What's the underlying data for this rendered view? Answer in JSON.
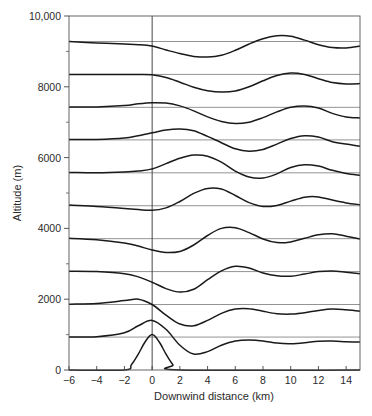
{
  "chart_data": {
    "type": "line",
    "title": "",
    "xlabel": "Downwind distance (km)",
    "ylabel": "Altitude (m)",
    "xlim": [
      -6,
      15
    ],
    "ylim": [
      0,
      10000
    ],
    "x_ticks": [
      -6,
      -4,
      -2,
      0,
      2,
      4,
      6,
      8,
      10,
      12,
      14
    ],
    "x_tick_labels": [
      "−6",
      "−4",
      "−2",
      "0",
      "2",
      "4",
      "6",
      "8",
      "10",
      "12",
      "14"
    ],
    "y_ticks": [
      0,
      2000,
      4000,
      6000,
      8000,
      10000
    ],
    "y_tick_labels": [
      "0",
      "2000",
      "4000",
      "6000",
      "8000",
      "10,000"
    ],
    "y_minor_ticks": [
      1000,
      3000,
      5000,
      7000,
      9000
    ],
    "grid": false,
    "legend": null,
    "vertical_reference_x": 0,
    "reference_levels_m": [
      0,
      930,
      1850,
      2780,
      3710,
      4640,
      5570,
      6500,
      7420,
      8350,
      9280
    ],
    "series": [
      {
        "name": "streamline-0",
        "level": 0,
        "points": [
          [
            -6,
            0
          ],
          [
            -2,
            0
          ],
          [
            -1.5,
            150
          ],
          [
            -1,
            450
          ],
          [
            -0.5,
            800
          ],
          [
            0,
            1000
          ],
          [
            0.5,
            800
          ],
          [
            1,
            450
          ],
          [
            1.5,
            150
          ],
          [
            2,
            0
          ],
          [
            15,
            0
          ]
        ]
      },
      {
        "name": "streamline-1",
        "level": 930,
        "points": [
          [
            -6,
            930
          ],
          [
            -4,
            940
          ],
          [
            -2,
            1050
          ],
          [
            -1,
            1250
          ],
          [
            0,
            1400
          ],
          [
            1,
            1150
          ],
          [
            2,
            700
          ],
          [
            3,
            450
          ],
          [
            4,
            520
          ],
          [
            5,
            700
          ],
          [
            6,
            820
          ],
          [
            7,
            850
          ],
          [
            8,
            820
          ],
          [
            9,
            760
          ],
          [
            10,
            740
          ],
          [
            11,
            770
          ],
          [
            12,
            810
          ],
          [
            13,
            820
          ],
          [
            14,
            800
          ],
          [
            15,
            790
          ]
        ]
      },
      {
        "name": "streamline-2",
        "level": 1850,
        "points": [
          [
            -6,
            1860
          ],
          [
            -4,
            1880
          ],
          [
            -2,
            1960
          ],
          [
            -1,
            2000
          ],
          [
            0,
            1850
          ],
          [
            1,
            1550
          ],
          [
            2,
            1300
          ],
          [
            3,
            1250
          ],
          [
            4,
            1400
          ],
          [
            5,
            1600
          ],
          [
            6,
            1720
          ],
          [
            7,
            1730
          ],
          [
            8,
            1660
          ],
          [
            9,
            1590
          ],
          [
            10,
            1580
          ],
          [
            11,
            1620
          ],
          [
            12,
            1680
          ],
          [
            13,
            1720
          ],
          [
            14,
            1700
          ],
          [
            15,
            1660
          ]
        ]
      },
      {
        "name": "streamline-3",
        "level": 2780,
        "points": [
          [
            -6,
            2790
          ],
          [
            -4,
            2780
          ],
          [
            -2,
            2720
          ],
          [
            -1,
            2630
          ],
          [
            0,
            2480
          ],
          [
            1,
            2300
          ],
          [
            2,
            2200
          ],
          [
            3,
            2280
          ],
          [
            4,
            2550
          ],
          [
            5,
            2800
          ],
          [
            6,
            2930
          ],
          [
            7,
            2880
          ],
          [
            8,
            2740
          ],
          [
            9,
            2660
          ],
          [
            10,
            2650
          ],
          [
            11,
            2710
          ],
          [
            12,
            2780
          ],
          [
            13,
            2800
          ],
          [
            14,
            2760
          ],
          [
            15,
            2720
          ]
        ]
      },
      {
        "name": "streamline-4",
        "level": 3710,
        "points": [
          [
            -6,
            3720
          ],
          [
            -4,
            3680
          ],
          [
            -2,
            3590
          ],
          [
            -1,
            3500
          ],
          [
            0,
            3390
          ],
          [
            1,
            3320
          ],
          [
            2,
            3350
          ],
          [
            3,
            3530
          ],
          [
            4,
            3800
          ],
          [
            5,
            4000
          ],
          [
            6,
            4020
          ],
          [
            7,
            3880
          ],
          [
            8,
            3700
          ],
          [
            9,
            3600
          ],
          [
            10,
            3620
          ],
          [
            11,
            3720
          ],
          [
            12,
            3820
          ],
          [
            13,
            3850
          ],
          [
            14,
            3780
          ],
          [
            15,
            3700
          ]
        ]
      },
      {
        "name": "streamline-5",
        "level": 4640,
        "points": [
          [
            -6,
            4660
          ],
          [
            -4,
            4620
          ],
          [
            -2,
            4560
          ],
          [
            -1,
            4530
          ],
          [
            0,
            4510
          ],
          [
            1,
            4580
          ],
          [
            2,
            4760
          ],
          [
            3,
            4990
          ],
          [
            4,
            5130
          ],
          [
            5,
            5110
          ],
          [
            6,
            4930
          ],
          [
            7,
            4730
          ],
          [
            8,
            4620
          ],
          [
            9,
            4650
          ],
          [
            10,
            4770
          ],
          [
            11,
            4880
          ],
          [
            12,
            4890
          ],
          [
            13,
            4800
          ],
          [
            14,
            4720
          ],
          [
            15,
            4670
          ]
        ]
      },
      {
        "name": "streamline-6",
        "level": 5570,
        "points": [
          [
            -6,
            5580
          ],
          [
            -4,
            5570
          ],
          [
            -2,
            5590
          ],
          [
            -1,
            5620
          ],
          [
            0,
            5680
          ],
          [
            1,
            5830
          ],
          [
            2,
            5980
          ],
          [
            3,
            6070
          ],
          [
            4,
            6040
          ],
          [
            5,
            5870
          ],
          [
            6,
            5620
          ],
          [
            7,
            5450
          ],
          [
            8,
            5420
          ],
          [
            9,
            5540
          ],
          [
            10,
            5720
          ],
          [
            11,
            5800
          ],
          [
            12,
            5760
          ],
          [
            13,
            5640
          ],
          [
            14,
            5550
          ],
          [
            15,
            5500
          ]
        ]
      },
      {
        "name": "streamline-7",
        "level": 6500,
        "points": [
          [
            -6,
            6510
          ],
          [
            -4,
            6510
          ],
          [
            -2,
            6550
          ],
          [
            -1,
            6620
          ],
          [
            0,
            6700
          ],
          [
            1,
            6780
          ],
          [
            2,
            6810
          ],
          [
            3,
            6760
          ],
          [
            4,
            6600
          ],
          [
            5,
            6420
          ],
          [
            6,
            6250
          ],
          [
            7,
            6180
          ],
          [
            8,
            6230
          ],
          [
            9,
            6380
          ],
          [
            10,
            6540
          ],
          [
            11,
            6620
          ],
          [
            12,
            6580
          ],
          [
            13,
            6450
          ],
          [
            14,
            6380
          ],
          [
            15,
            6320
          ]
        ]
      },
      {
        "name": "streamline-8",
        "level": 7420,
        "points": [
          [
            -6,
            7430
          ],
          [
            -4,
            7430
          ],
          [
            -2,
            7470
          ],
          [
            -1,
            7520
          ],
          [
            0,
            7550
          ],
          [
            1,
            7540
          ],
          [
            2,
            7460
          ],
          [
            3,
            7320
          ],
          [
            4,
            7150
          ],
          [
            5,
            7020
          ],
          [
            6,
            6960
          ],
          [
            7,
            7000
          ],
          [
            8,
            7130
          ],
          [
            9,
            7290
          ],
          [
            10,
            7420
          ],
          [
            11,
            7460
          ],
          [
            12,
            7400
          ],
          [
            13,
            7250
          ],
          [
            14,
            7150
          ],
          [
            15,
            7120
          ]
        ]
      },
      {
        "name": "streamline-9",
        "level": 8350,
        "points": [
          [
            -6,
            8350
          ],
          [
            -4,
            8350
          ],
          [
            -2,
            8350
          ],
          [
            -1,
            8350
          ],
          [
            0,
            8340
          ],
          [
            1,
            8260
          ],
          [
            2,
            8130
          ],
          [
            3,
            7990
          ],
          [
            4,
            7890
          ],
          [
            5,
            7850
          ],
          [
            6,
            7880
          ],
          [
            7,
            8000
          ],
          [
            8,
            8170
          ],
          [
            9,
            8320
          ],
          [
            10,
            8390
          ],
          [
            11,
            8350
          ],
          [
            12,
            8230
          ],
          [
            13,
            8120
          ],
          [
            14,
            8080
          ],
          [
            15,
            8090
          ]
        ]
      },
      {
        "name": "streamline-10",
        "level": 9280,
        "points": [
          [
            -6,
            9280
          ],
          [
            -4,
            9240
          ],
          [
            -2,
            9210
          ],
          [
            -1,
            9190
          ],
          [
            0,
            9150
          ],
          [
            1,
            9040
          ],
          [
            2,
            8940
          ],
          [
            3,
            8860
          ],
          [
            4,
            8840
          ],
          [
            5,
            8890
          ],
          [
            6,
            9030
          ],
          [
            7,
            9210
          ],
          [
            8,
            9360
          ],
          [
            9,
            9440
          ],
          [
            10,
            9430
          ],
          [
            11,
            9320
          ],
          [
            12,
            9190
          ],
          [
            13,
            9110
          ],
          [
            14,
            9100
          ],
          [
            15,
            9150
          ]
        ]
      }
    ]
  }
}
